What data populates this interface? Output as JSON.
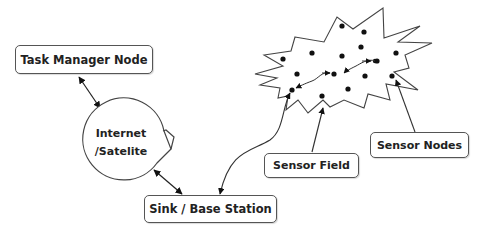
{
  "diagram": {
    "nodes": {
      "task_manager": {
        "label": "Task Manager Node"
      },
      "internet": {
        "label_line1": "Internet",
        "label_line2": "/Satelite"
      },
      "sink": {
        "label": "Sink / Base Station"
      },
      "sensor_field": {
        "label": "Sensor Field"
      },
      "sensor_nodes": {
        "label": "Sensor Nodes"
      }
    },
    "edges": [
      {
        "from": "Task Manager Node",
        "to": "Internet /Satelite",
        "type": "bidirectional"
      },
      {
        "from": "Internet /Satelite",
        "to": "Sink / Base Station",
        "type": "bidirectional"
      },
      {
        "from": "Sensor Field region node",
        "to": "Sink / Base Station",
        "type": "directed"
      },
      {
        "from": "Sensor Field",
        "to": "sensor field boundary",
        "type": "pointer"
      },
      {
        "from": "Sensor Nodes",
        "to": "sensor node",
        "type": "pointer"
      }
    ],
    "colors": {
      "stroke": "#333333",
      "node_fill": "#111111",
      "background": "#ffffff"
    }
  }
}
